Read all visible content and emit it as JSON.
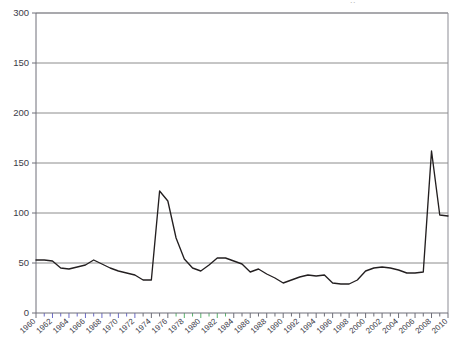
{
  "figure": {
    "clipped_top_text": "..",
    "background_color": "#ffffff",
    "line_color": "#231f20",
    "grid_color": "#7f7f7f",
    "axis_color": "#6e6e78",
    "tick_accent_blue": "#6b6bc8",
    "tick_accent_green": "#58b36b"
  },
  "chart_data": {
    "type": "line",
    "title": "",
    "subtitle": "",
    "xlabel": "",
    "ylabel": "",
    "grid": true,
    "legend": "none",
    "xlim": [
      1960,
      2010
    ],
    "ylim": [
      0,
      300
    ],
    "y_tick_values": [
      0,
      50,
      100,
      150,
      200,
      250,
      300
    ],
    "y_tick_labels": [
      "0",
      "50",
      "100",
      "150",
      "200",
      "150",
      "300"
    ],
    "y_tick_labels_note": "As rendered in the source image, top-to-bottom: 300, 150, 200, 150, 100, 50, 0",
    "x_tick_labels": [
      "1960",
      "1962",
      "1964",
      "1966",
      "1968",
      "1970",
      "1972",
      "1974",
      "1976",
      "1978",
      "1980",
      "1982",
      "1984",
      "1986",
      "1988",
      "1990",
      "1992",
      "1994",
      "1996",
      "1998",
      "2000",
      "2002",
      "2004",
      "2006",
      "2008",
      "2010"
    ],
    "x_minor_tick_step": 1,
    "series": [
      {
        "name": "series-1",
        "color": "#231f20",
        "x": [
          1960,
          1961,
          1962,
          1963,
          1964,
          1965,
          1966,
          1967,
          1968,
          1969,
          1970,
          1971,
          1972,
          1973,
          1974,
          1975,
          1976,
          1977,
          1978,
          1979,
          1980,
          1981,
          1982,
          1983,
          1984,
          1985,
          1986,
          1987,
          1988,
          1989,
          1990,
          1991,
          1992,
          1993,
          1994,
          1995,
          1996,
          1997,
          1998,
          1999,
          2000,
          2001,
          2002,
          2003,
          2004,
          2005,
          2006,
          2007,
          2008,
          2009,
          2010
        ],
        "y": [
          53,
          53,
          52,
          45,
          44,
          46,
          48,
          53,
          49,
          45,
          42,
          40,
          38,
          33,
          33,
          122,
          112,
          75,
          54,
          45,
          42,
          48,
          55,
          55,
          52,
          49,
          41,
          44,
          39,
          35,
          30,
          33,
          36,
          38,
          37,
          38,
          30,
          29,
          29,
          33,
          42,
          45,
          46,
          45,
          43,
          40,
          40,
          41,
          162,
          98,
          97
        ]
      }
    ],
    "annotations": [
      {
        "label": "1974-75 spike peak",
        "x": 1975,
        "y": 122
      },
      {
        "label": "2008 spike peak",
        "x": 2008,
        "y": 162
      },
      {
        "label": "final value",
        "x": 2010,
        "y": 97
      }
    ]
  }
}
